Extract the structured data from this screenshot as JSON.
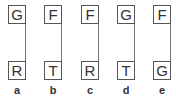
{
  "figures": [
    {
      "top": "G",
      "bottom": "R",
      "label": "a"
    },
    {
      "top": "F",
      "bottom": "T",
      "label": "b"
    },
    {
      "top": "F",
      "bottom": "R",
      "label": "c"
    },
    {
      "top": "G",
      "bottom": "T",
      "label": "d"
    },
    {
      "top": "F",
      "bottom": "G",
      "label": "e"
    }
  ]
}
